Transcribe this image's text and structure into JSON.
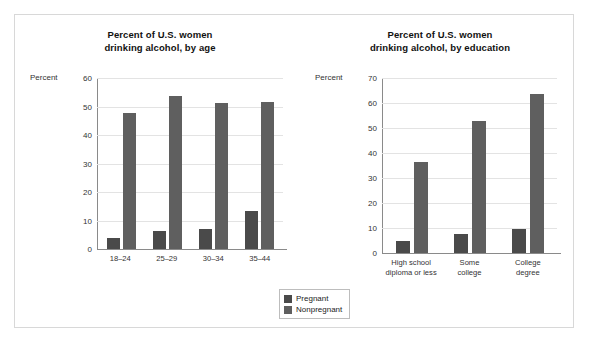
{
  "figure": {
    "legend": {
      "items": [
        {
          "label": "Pregnant",
          "color": "#4a4a4a",
          "key": "pregnant"
        },
        {
          "label": "Nonpregnant",
          "color": "#5f5f5f",
          "key": "nonpregnant"
        }
      ]
    }
  },
  "chart_data": [
    {
      "type": "bar",
      "title": "Percent of U.S. women drinking alcohol, by age",
      "title_lines": [
        "Percent of U.S. women",
        "drinking alcohol, by age"
      ],
      "xlabel": "",
      "ylabel": "Percent",
      "ylim": [
        0,
        60
      ],
      "yticks": [
        0,
        10,
        20,
        30,
        40,
        50,
        60
      ],
      "ytick_labels": [
        "0",
        "10",
        "20",
        "30",
        "40",
        "50",
        "60"
      ],
      "grid": true,
      "legend_position": "bottom-center",
      "categories": [
        "18–24",
        "25–29",
        "30–34",
        "35–44"
      ],
      "category_lines": [
        [
          "18–24"
        ],
        [
          "25–29"
        ],
        [
          "30–34"
        ],
        [
          "35–44"
        ]
      ],
      "series": [
        {
          "name": "Pregnant",
          "color": "#4a4a4a",
          "values": [
            4,
            6.5,
            7,
            13.5
          ]
        },
        {
          "name": "Nonpregnant",
          "color": "#5f5f5f",
          "values": [
            48,
            54,
            51.5,
            52
          ]
        }
      ]
    },
    {
      "type": "bar",
      "title": "Percent of U.S. women drinking alcohol, by education",
      "title_lines": [
        "Percent of U.S. women",
        "drinking alcohol, by education"
      ],
      "xlabel": "",
      "ylabel": "Percent",
      "ylim": [
        0,
        70
      ],
      "yticks": [
        0,
        10,
        20,
        30,
        40,
        50,
        60,
        70
      ],
      "ytick_labels": [
        "0",
        "10",
        "20",
        "30",
        "40",
        "50",
        "60",
        "70"
      ],
      "grid": true,
      "legend_position": "bottom-center",
      "categories": [
        "High school diploma or less",
        "Some college",
        "College degree"
      ],
      "category_lines": [
        [
          "High school",
          "diploma or less"
        ],
        [
          "Some",
          "college"
        ],
        [
          "College",
          "degree"
        ]
      ],
      "series": [
        {
          "name": "Pregnant",
          "color": "#4a4a4a",
          "values": [
            5,
            7.5,
            9.5
          ]
        },
        {
          "name": "Nonpregnant",
          "color": "#5f5f5f",
          "values": [
            36.5,
            53,
            64
          ]
        }
      ]
    }
  ]
}
